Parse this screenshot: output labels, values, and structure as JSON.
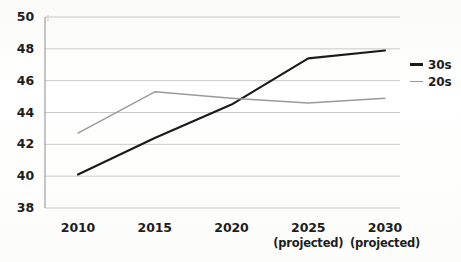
{
  "chart_data": {
    "type": "line",
    "title": "",
    "subtitle": "",
    "xlabel": "",
    "ylabel": "",
    "categories": [
      "2010",
      "2015",
      "2020",
      "2025",
      "2030"
    ],
    "category_sublabels": [
      "",
      "",
      "",
      "(projected)",
      "(projected)"
    ],
    "x_tick_labels": [
      "2010",
      "2015",
      "2020",
      "2025",
      "2030"
    ],
    "y_tick_labels": [
      "38",
      "40",
      "42",
      "44",
      "46",
      "48",
      "50"
    ],
    "y_tick_values": [
      38,
      40,
      42,
      44,
      46,
      48,
      50
    ],
    "ylim": [
      38,
      50
    ],
    "grid": true,
    "grid_axis": "y",
    "legend_position": "right",
    "series": [
      {
        "name": "30s",
        "color": "#1a1a1a",
        "values": [
          40.1,
          42.4,
          44.5,
          47.4,
          47.9
        ]
      },
      {
        "name": "20s",
        "color": "#9a9a9a",
        "values": [
          42.7,
          45.3,
          44.9,
          44.6,
          44.9
        ]
      }
    ]
  },
  "legend": {
    "items": [
      {
        "label": "30s",
        "color": "#1a1a1a"
      },
      {
        "label": "20s",
        "color": "#9a9a9a"
      }
    ]
  },
  "axes": {
    "y_axis_color": "#8c8c8c",
    "grid_color": "#c9c9c9",
    "tick_label_color": "#1d1d1b"
  }
}
